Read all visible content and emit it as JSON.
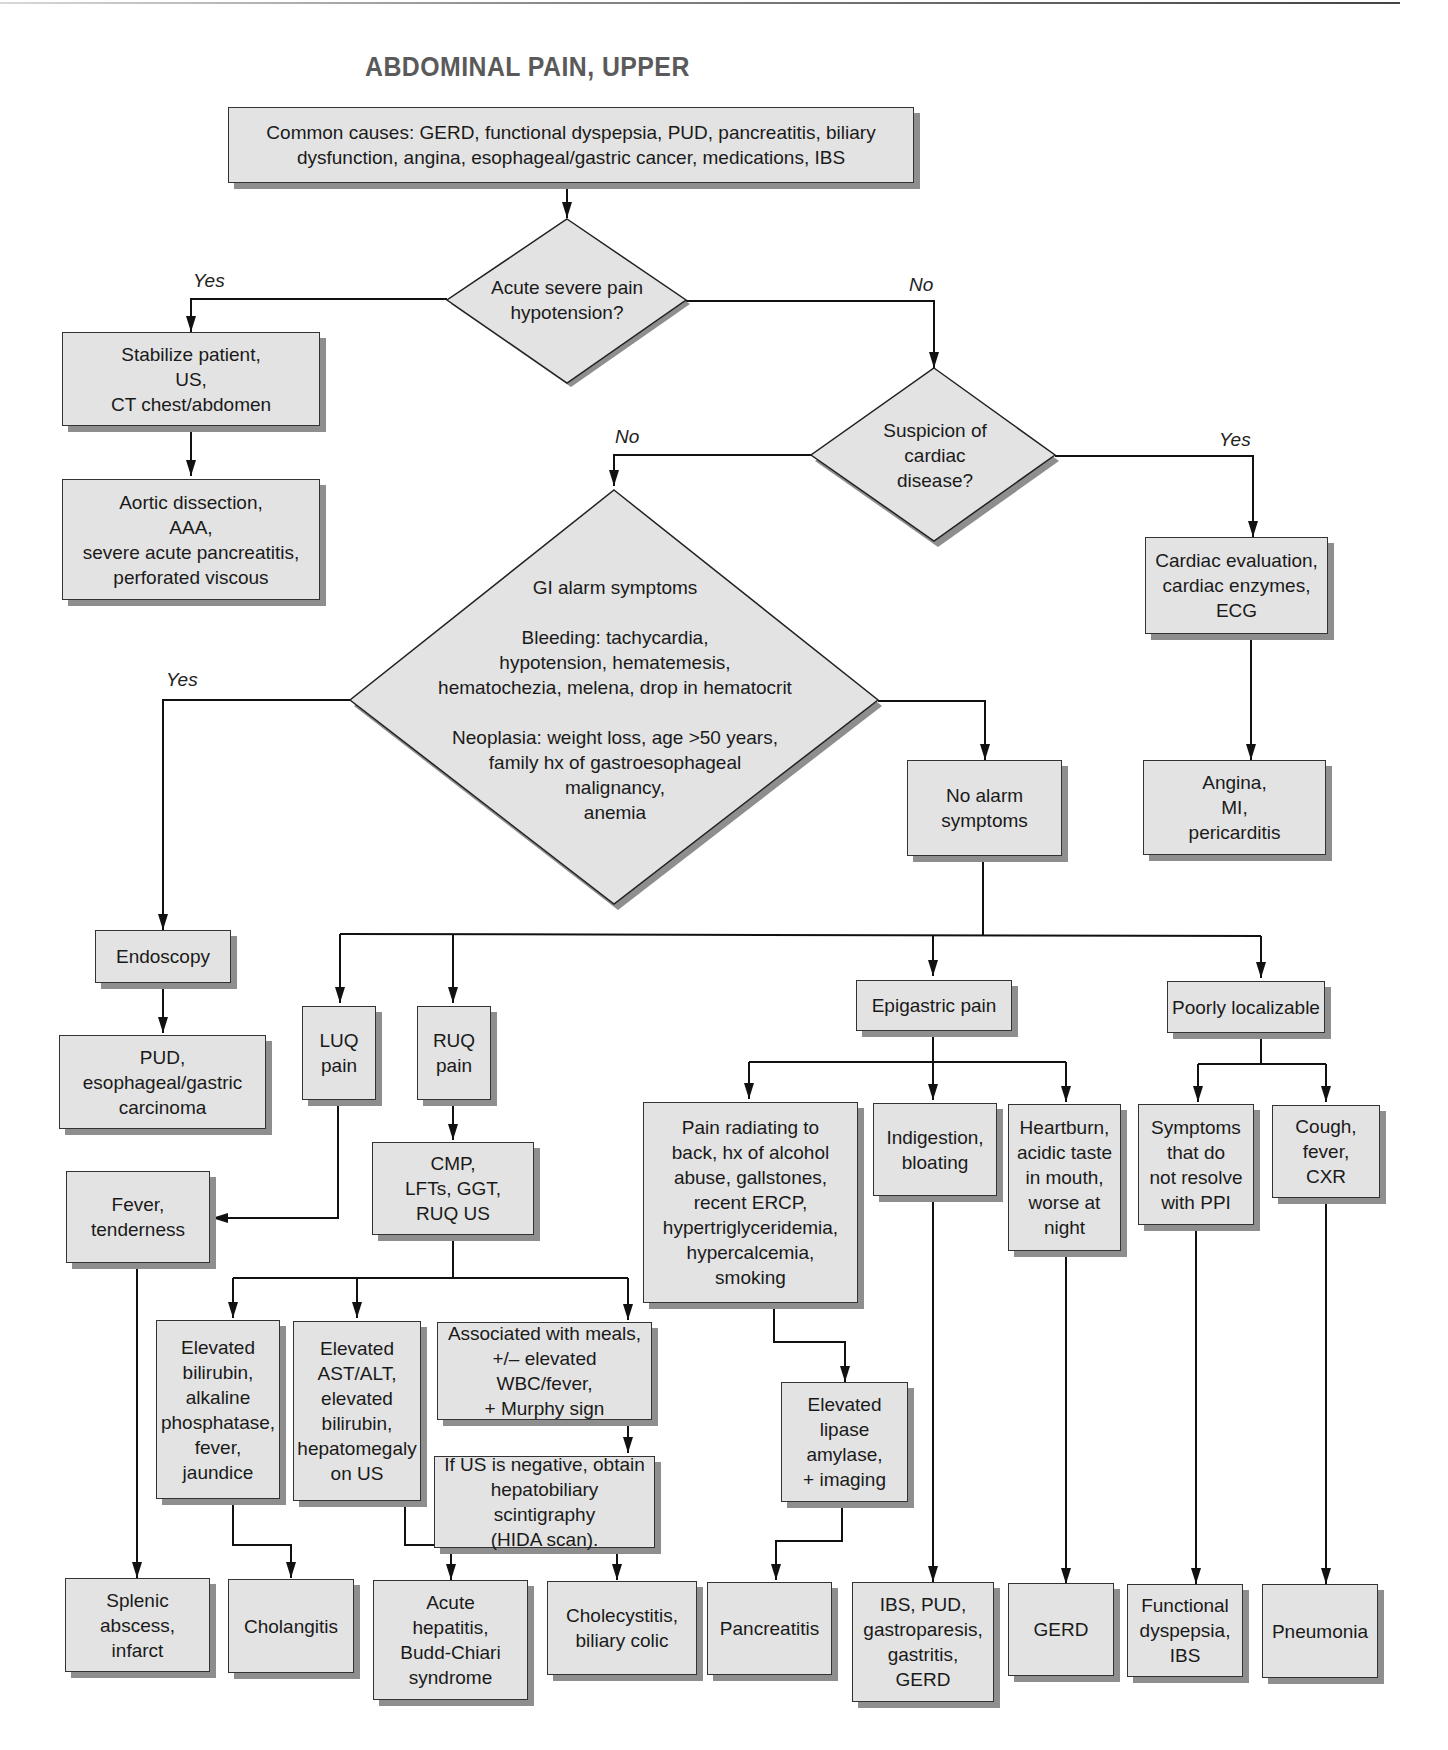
{
  "title": "ABDOMINAL PAIN, UPPER",
  "nodes": {
    "common_causes": "Common causes: GERD, functional dyspepsia, PUD, pancreatitis, biliary\ndysfunction, angina, esophageal/gastric cancer, medications, IBS",
    "acute_severe": "Acute severe pain\nhypotension?",
    "stabilize": "Stabilize patient,\nUS,\nCT chest/abdomen",
    "aortic": "Aortic dissection,\nAAA,\nsevere acute pancreatitis,\nperforated viscous",
    "cardiac_suspicion": "Suspicion of\ncardiac\ndisease?",
    "cardiac_eval": "Cardiac evaluation,\ncardiac enzymes,\nECG",
    "angina": "Angina,\nMI,\npericarditis",
    "gi_alarm": "GI alarm symptoms\n\nBleeding: tachycardia,\nhypotension, hematemesis,\nhematochezia, melena, drop in hematocrit\n\nNeoplasia: weight loss, age >50 years,\nfamily hx of gastroesophageal\nmalignancy,\nanemia",
    "no_alarm": "No alarm\nsymptoms",
    "endoscopy": "Endoscopy",
    "pud_carcinoma": "PUD,\nesophageal/gastric\ncarcinoma",
    "luq": "LUQ\npain",
    "ruq": "RUQ\npain",
    "cmp": "CMP,\nLFTs, GGT,\nRUQ US",
    "fever_tenderness": "Fever,\ntenderness",
    "elev_bili": "Elevated\nbilirubin,\nalkaline\nphosphatase,\nfever,\njaundice",
    "elev_ast": "Elevated\nAST/ALT,\nelevated\nbilirubin,\nhepatomegaly\non US",
    "meals": "Associated with meals,\n+/– elevated WBC/fever,\n+ Murphy sign",
    "hida": "If US is negative, obtain\nhepatobiliary scintigraphy\n(HIDA scan).",
    "epigastric": "Epigastric pain",
    "poorly": "Poorly localizable",
    "pain_radiating": "Pain radiating to\nback, hx of alcohol\nabuse, gallstones,\nrecent ERCP,\nhypertriglyceridemia,\nhypercalcemia,\nsmoking",
    "indigestion": "Indigestion,\nbloating",
    "heartburn": "Heartburn,\nacidic taste\nin mouth,\nworse at\nnight",
    "symptoms_ppi": "Symptoms\nthat do\nnot resolve\nwith PPI",
    "cough": "Cough,\nfever,\nCXR",
    "lipase": "Elevated\nlipase\namylase,\n+ imaging",
    "splenic": "Splenic\nabscess,\ninfarct",
    "cholangitis": "Cholangitis",
    "hepatitis": "Acute\nhepatitis,\nBudd-Chiari\nsyndrome",
    "cholecystitis": "Cholecystitis,\nbiliary colic",
    "pancreatitis": "Pancreatitis",
    "ibs_pud": "IBS, PUD,\ngastroparesis,\ngastritis,\nGERD",
    "gerd": "GERD",
    "functional": "Functional\ndyspepsia,\nIBS",
    "pneumonia": "Pneumonia"
  },
  "edge_labels": {
    "acute_yes": "Yes",
    "acute_no": "No",
    "cardiac_no": "No",
    "cardiac_yes": "Yes",
    "alarm_yes": "Yes"
  },
  "colors": {
    "box_fill": "#e3e3e3",
    "box_border": "#333333",
    "shadow": "#8e8e8e",
    "title": "#5a5a5a"
  }
}
